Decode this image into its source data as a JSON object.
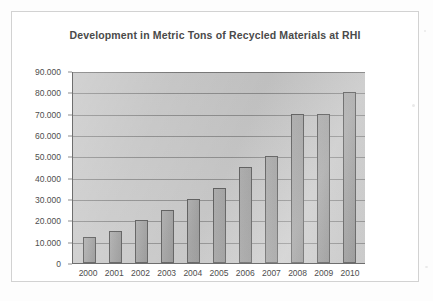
{
  "chart_data": {
    "type": "bar",
    "title": "Development in Metric Tons of Recycled Materials at RHI",
    "xlabel": "",
    "ylabel": "",
    "categories": [
      "2000",
      "2001",
      "2002",
      "2003",
      "2004",
      "2005",
      "2006",
      "2007",
      "2008",
      "2009",
      "2010"
    ],
    "values": [
      12000,
      15000,
      20000,
      25000,
      30000,
      35000,
      45000,
      50000,
      70000,
      70000,
      80000
    ],
    "value_labels": [
      "12.000",
      "15.000",
      "20.000",
      "25.000",
      "30.000",
      "35.000",
      "45.000",
      "50.000",
      "70.000",
      "70.000",
      "80.000"
    ],
    "ylim": [
      0,
      90000
    ],
    "ytick_values": [
      0,
      10000,
      20000,
      30000,
      40000,
      50000,
      60000,
      70000,
      80000,
      90000
    ],
    "ytick_labels": [
      "0",
      "10.000",
      "20.000",
      "30.000",
      "40.000",
      "50.000",
      "60.000",
      "70.000",
      "80.000",
      "90.000"
    ],
    "grid": true,
    "legend": false,
    "legend_position": "none",
    "series": [
      {
        "name": "Recycled Materials (metric tons)",
        "values": [
          12000,
          15000,
          20000,
          25000,
          30000,
          35000,
          45000,
          50000,
          70000,
          70000,
          80000
        ]
      }
    ],
    "colors": {
      "bar_fill": "#9b9b9b",
      "bar_border": "#575757",
      "plot_background": "#c9c9c9",
      "gridline": "#8e8e8e",
      "axis": "#6e6e6e",
      "title_text": "#4a4a4a",
      "tick_text": "#4e4e4e",
      "frame_border": "#d2d2d2",
      "page_background": "#fdfdfd"
    }
  }
}
